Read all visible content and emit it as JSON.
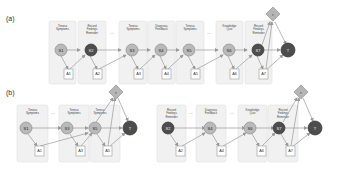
{
  "panels": {
    "a": {
      "label": "(a)",
      "boxes": [
        {
          "label": [
            "Tenesa",
            "Symptoms"
          ],
          "state": "S1",
          "state_style": "light",
          "action": "A1"
        },
        {
          "label": [
            "Record",
            "Findings",
            "Reminder"
          ],
          "state": "S2",
          "state_style": "dark",
          "action": "A2"
        },
        {
          "label": [
            "Tenesa",
            "Symptoms"
          ],
          "state": "S3",
          "state_style": "light",
          "action": "A3"
        },
        {
          "label": [
            "Diagnosis",
            "Feedback"
          ],
          "state": "S4",
          "state_style": "light",
          "action": "A4"
        },
        {
          "label": [
            "Tenesa",
            "Symptoms"
          ],
          "state": "S5",
          "state_style": "light",
          "action": "A5"
        },
        {
          "label": [
            "Knowledge",
            "Quiz"
          ],
          "state": "S6",
          "state_style": "light",
          "action": "A6"
        },
        {
          "label": [
            "Record",
            "Findings",
            "Reminder"
          ],
          "state": "S7",
          "state_style": "dark",
          "action": "A7"
        }
      ],
      "ellipses": [
        "...",
        "..."
      ],
      "terminal": "T",
      "reward": "r"
    },
    "b": {
      "label": "(b)",
      "left_group": {
        "boxes": [
          {
            "label": [
              "Tenesa",
              "Symptoms"
            ],
            "state": "S1",
            "state_style": "light",
            "action": "A1"
          },
          {
            "label": [
              "Tenesa",
              "Symptoms"
            ],
            "state": "S3",
            "state_style": "light",
            "action": "A3"
          },
          {
            "label": [
              "Tenesa",
              "Symptoms"
            ],
            "state": "S5",
            "state_style": "light",
            "action": "A5"
          }
        ],
        "ellipsis": "...",
        "terminal": "T",
        "reward": "r"
      },
      "right_group": {
        "boxes": [
          {
            "label": [
              "Record",
              "Findings",
              "Reminder"
            ],
            "state": "S2",
            "state_style": "dark",
            "action": "A2"
          },
          {
            "label": [
              "Diagnosis",
              "Feedback"
            ],
            "state": "S4",
            "state_style": "light",
            "action": "A4"
          },
          {
            "label": [
              "Knowledge",
              "Quiz"
            ],
            "state": "S6",
            "state_style": "light",
            "action": "A6"
          },
          {
            "label": [
              "Record",
              "Findings",
              "Reminder"
            ],
            "state": "S7",
            "state_style": "dark",
            "action": "A7"
          }
        ],
        "ellipses": [
          "...",
          "..."
        ],
        "terminal": "T",
        "reward": "r"
      }
    }
  },
  "colors": {
    "box_fill": "#f1f1f1",
    "state_light": "#b9b9b9",
    "state_dark": "#4d4d4d",
    "edge": "#9a9a9a",
    "reward_diamond": "#b5b5b5"
  }
}
